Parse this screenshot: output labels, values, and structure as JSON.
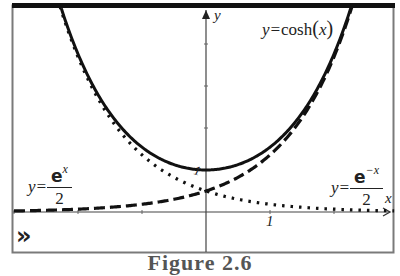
{
  "chart_data": {
    "type": "line",
    "title": "",
    "xlabel": "x",
    "ylabel": "y",
    "xlim": [
      -3.0,
      2.95
    ],
    "ylim": [
      -0.95,
      4.95
    ],
    "grid": false,
    "tick_labels": {
      "x": [
        "1"
      ],
      "y": [
        "1"
      ]
    },
    "x_ticks": [
      -3,
      -2,
      -1,
      0,
      1,
      2
    ],
    "y_ticks": [
      1,
      2,
      3,
      4
    ],
    "series": [
      {
        "name": "y=cosh(x)",
        "function": "cosh(x)",
        "style": "solid",
        "x": [
          -2.2,
          -2.0,
          -1.5,
          -1.0,
          -0.5,
          0,
          0.5,
          1.0,
          1.5,
          2.0,
          2.2
        ],
        "values": [
          4.57,
          3.76,
          2.35,
          1.54,
          1.13,
          1.0,
          1.13,
          1.54,
          2.35,
          3.76,
          4.57
        ]
      },
      {
        "name": "y=e^x/2",
        "function": "exp(x)/2",
        "style": "dashed",
        "x": [
          -3.0,
          -2.0,
          -1.0,
          0,
          0.5,
          1.0,
          1.5,
          2.0,
          2.2
        ],
        "values": [
          0.025,
          0.068,
          0.184,
          0.5,
          0.824,
          1.359,
          2.241,
          3.695,
          4.51
        ]
      },
      {
        "name": "y=e^-x/2",
        "function": "exp(-x)/2",
        "style": "dotted",
        "x": [
          -2.2,
          -2.0,
          -1.5,
          -1.0,
          -0.5,
          0,
          1.0,
          2.0,
          2.9
        ],
        "values": [
          4.51,
          3.695,
          2.241,
          1.359,
          0.824,
          0.5,
          0.184,
          0.068,
          0.028
        ]
      }
    ],
    "annotations": [
      {
        "text": "y=cosh(x)",
        "position": "top-right"
      },
      {
        "text": "y=e^x/2",
        "position": "left"
      },
      {
        "text": "y=e^-x/2",
        "position": "right"
      }
    ]
  },
  "labels": {
    "y_axis": "y",
    "x_axis": "x",
    "x_tick_one": "1",
    "y_tick_one": "1",
    "cosh_prefix": "y=",
    "cosh_func": "cosh",
    "cosh_open": "(",
    "cosh_var": "x",
    "cosh_close": ")",
    "left_prefix": "y=",
    "left_num_base": "e",
    "left_num_exp": "x",
    "left_den": "2",
    "right_prefix": "y=",
    "right_num_base": "e",
    "right_num_exp": "−x",
    "right_den": "2",
    "expand_glyph": "»"
  },
  "caption": "Figure 2.6"
}
